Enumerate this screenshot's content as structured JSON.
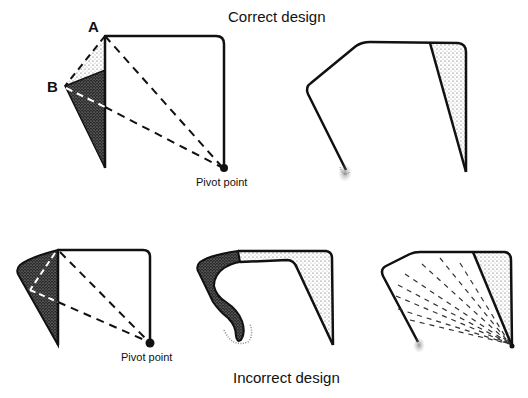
{
  "titles": {
    "correct": "Correct design",
    "incorrect": "Incorrect design"
  },
  "points": {
    "a": "A",
    "b": "B"
  },
  "labels": {
    "pivot_top": "Pivot point",
    "pivot_bottom": "Pivot point"
  },
  "colors": {
    "stroke": "#111111",
    "dark_fill": "#3a3a3a",
    "light_fill": "#c9c9c9",
    "background": "#ffffff"
  }
}
